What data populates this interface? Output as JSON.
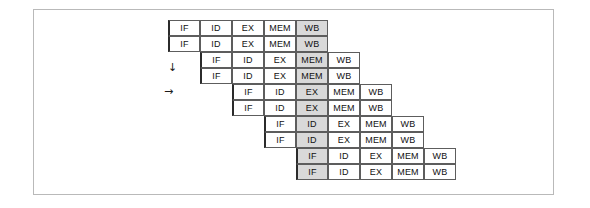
{
  "figure": {
    "clipped_header_text": "",
    "stage_labels": [
      "IF",
      "ID",
      "EX",
      "MEM",
      "WB"
    ],
    "markers": [
      {
        "name": "down-arrow",
        "glyph": "↓",
        "x": 168,
        "y": 62
      },
      {
        "name": "right-arrow",
        "glyph": "→",
        "x": 164,
        "y": 86
      }
    ]
  },
  "chart_data": {
    "type": "table",
    "title": "",
    "xlabel": "",
    "ylabel": "",
    "columns": [
      "IF",
      "ID",
      "EX",
      "MEM",
      "WB"
    ],
    "cell_width": 32,
    "cell_height": 16,
    "origin_x": 168,
    "origin_y": 20,
    "row_step_y": 16,
    "pair_shift_x": 32,
    "shaded_fill": "#d9d9d9",
    "cell_fill": "#ffffff",
    "border_color": "#5d5d5d",
    "rows": [
      {
        "index": 0,
        "pair": 0,
        "offset_cells": 0,
        "stages": [
          "IF",
          "ID",
          "EX",
          "MEM",
          "WB"
        ],
        "shaded_stage": "WB"
      },
      {
        "index": 1,
        "pair": 0,
        "offset_cells": 0,
        "stages": [
          "IF",
          "ID",
          "EX",
          "MEM",
          "WB"
        ],
        "shaded_stage": "WB"
      },
      {
        "index": 2,
        "pair": 1,
        "offset_cells": 1,
        "stages": [
          "IF",
          "ID",
          "EX",
          "MEM",
          "WB"
        ],
        "shaded_stage": "MEM"
      },
      {
        "index": 3,
        "pair": 1,
        "offset_cells": 1,
        "stages": [
          "IF",
          "ID",
          "EX",
          "MEM",
          "WB"
        ],
        "shaded_stage": "MEM"
      },
      {
        "index": 4,
        "pair": 2,
        "offset_cells": 2,
        "stages": [
          "IF",
          "ID",
          "EX",
          "MEM",
          "WB"
        ],
        "shaded_stage": "EX"
      },
      {
        "index": 5,
        "pair": 2,
        "offset_cells": 2,
        "stages": [
          "IF",
          "ID",
          "EX",
          "MEM",
          "WB"
        ],
        "shaded_stage": "EX"
      },
      {
        "index": 6,
        "pair": 3,
        "offset_cells": 3,
        "stages": [
          "IF",
          "ID",
          "EX",
          "MEM",
          "WB"
        ],
        "shaded_stage": "ID"
      },
      {
        "index": 7,
        "pair": 3,
        "offset_cells": 3,
        "stages": [
          "IF",
          "ID",
          "EX",
          "MEM",
          "WB"
        ],
        "shaded_stage": "ID"
      },
      {
        "index": 8,
        "pair": 4,
        "offset_cells": 4,
        "stages": [
          "IF",
          "ID",
          "EX",
          "MEM",
          "WB"
        ],
        "shaded_stage": "IF"
      },
      {
        "index": 9,
        "pair": 4,
        "offset_cells": 4,
        "stages": [
          "IF",
          "ID",
          "EX",
          "MEM",
          "WB"
        ],
        "shaded_stage": "IF"
      }
    ]
  }
}
